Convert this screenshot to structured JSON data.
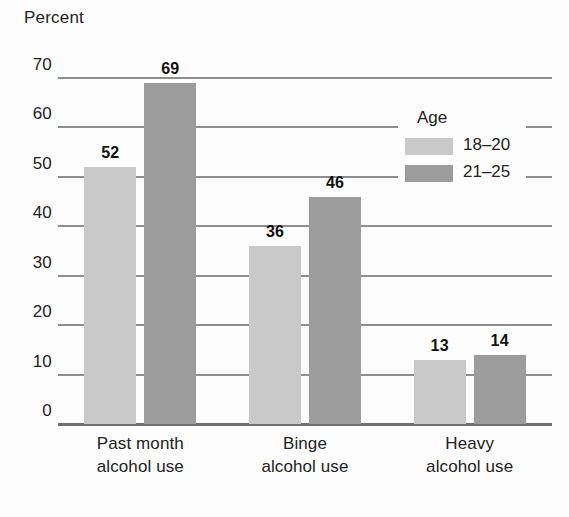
{
  "chart_data": {
    "type": "bar",
    "title": "",
    "xlabel": "",
    "ylabel": "Percent",
    "ylim": [
      0,
      70
    ],
    "ytick_step": 10,
    "yticks": [
      70,
      60,
      50,
      40,
      30,
      20,
      10,
      0
    ],
    "grid": true,
    "categories": [
      "Past month\nalcohol use",
      "Binge\nalcohol use",
      "Heavy\nalcohol use"
    ],
    "categories_lines": [
      [
        "Past month",
        "alcohol use"
      ],
      [
        "Binge",
        "alcohol use"
      ],
      [
        "Heavy",
        "alcohol use"
      ]
    ],
    "legend": {
      "title": "Age",
      "position": "upper-right",
      "entries": [
        "18–20",
        "21–25"
      ]
    },
    "series": [
      {
        "name": "18–20",
        "color": "#c9c9c9",
        "values": [
          52,
          36,
          13
        ],
        "labels": [
          "52",
          "36",
          "13"
        ]
      },
      {
        "name": "21–25",
        "color": "#9c9c9c",
        "values": [
          69,
          46,
          14
        ],
        "labels": [
          "69",
          "46",
          "14"
        ]
      }
    ],
    "colors": {
      "series_0": "#c9c9c9",
      "series_1": "#9c9c9c",
      "gridline": "#8e8e8e",
      "axis": "#6f6f6f",
      "text": "#222222",
      "background": "#fdfdfd"
    }
  }
}
